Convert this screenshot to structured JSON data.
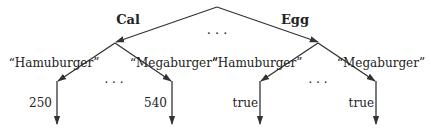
{
  "diagram": {
    "type": "tree",
    "root": {
      "edges": [
        {
          "label": "Cal",
          "child": "cal_node"
        },
        {
          "label": "Egg",
          "child": "egg_node"
        }
      ],
      "ellipsis": "· · ·"
    },
    "cal_node": {
      "edge_label": "Cal",
      "children": [
        {
          "key": "“Hamuburger”",
          "value": "250"
        },
        {
          "key": "“Megaburger”",
          "value": "540"
        }
      ],
      "ellipsis": "· · ·"
    },
    "egg_node": {
      "edge_label": "Egg",
      "children": [
        {
          "key": "“Hamuburger”",
          "value": "true"
        },
        {
          "key": "“Megaburger”",
          "value": "true"
        }
      ],
      "ellipsis": "· · ·"
    },
    "colors": {
      "line": "#333333",
      "text": "#222222"
    }
  }
}
